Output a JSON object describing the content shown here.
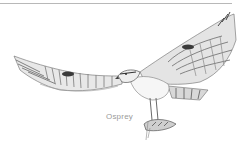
{
  "figure": {
    "caption": "Osprey",
    "colors": {
      "background": "#ffffff",
      "rule": "#b8b8b8",
      "ink_dark": "#3a3a3a",
      "ink_mid": "#7a7a7a",
      "ink_light": "#c4c4c4",
      "caption": "#9a9a9a"
    }
  }
}
